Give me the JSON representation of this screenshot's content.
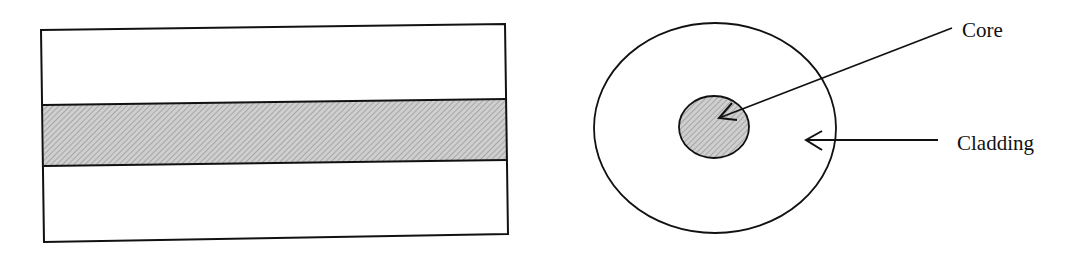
{
  "diagram": {
    "labels": {
      "core": "Core",
      "cladding": "Cladding"
    },
    "colors": {
      "stroke": "#111111",
      "core_fill": "#c8c8c8",
      "hatch": "#8a8a8a",
      "background": "#ffffff"
    },
    "longitudinal_view": {
      "outer_rect": {
        "x": 42,
        "y": 25,
        "width": 466,
        "height": 217
      },
      "core_band": {
        "y_top": 103,
        "y_bottom": 164
      }
    },
    "cross_section_view": {
      "cladding_circle": {
        "cx": 715,
        "cy": 128,
        "rx": 121,
        "ry": 105
      },
      "core_circle": {
        "cx": 714,
        "cy": 127,
        "rx": 35,
        "ry": 31
      }
    },
    "arrows": [
      {
        "name": "core-arrow",
        "from": [
          952,
          28
        ],
        "to": [
          719,
          118
        ]
      },
      {
        "name": "cladding-arrow",
        "from": [
          938,
          140
        ],
        "to": [
          806,
          140
        ]
      }
    ]
  }
}
